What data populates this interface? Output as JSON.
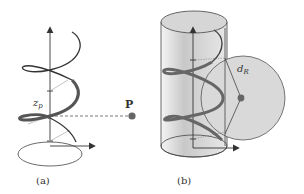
{
  "figure": {
    "panel_a": {
      "caption": "(a)",
      "height_label": "z",
      "height_label_sub": "p",
      "point_label": "P"
    },
    "panel_b": {
      "caption": "(b)",
      "distance_label": "d",
      "distance_label_sub": "R"
    },
    "colors": {
      "stroke": "#3a3a3a",
      "helix_thick": "#5a5a5a",
      "cylinder_fill": "#d8d8d8",
      "sphere_fill": "#d9d9d9",
      "point": "#666666"
    }
  }
}
